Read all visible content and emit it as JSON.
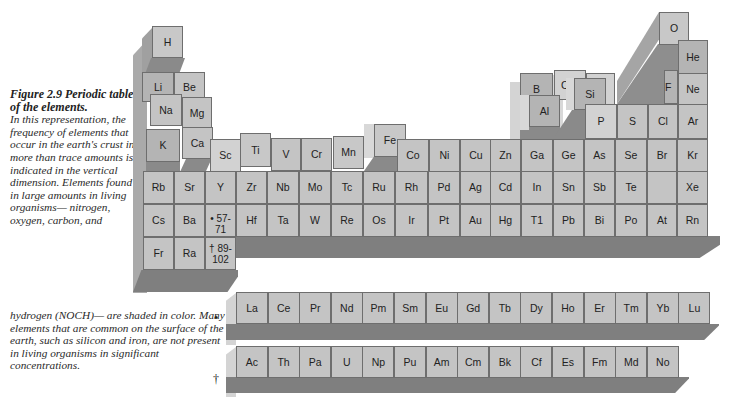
{
  "caption": {
    "title": "Figure 2.9 Periodic table of the elements.",
    "body_left": "In this representation, the frequency of elements that occur in the earth's crust in more than trace amounts is indicated in the vertical dimension. Elements found in large amounts in living organisms— nitrogen, oxygen, carbon, and",
    "body_tail": "hydrogen (NOCH)— are shaded in color. Many elements that are common on the surface of the earth, such as silicon and iron, are not present in living organisms in significant concentrations."
  },
  "main_table": {
    "raised": {
      "H": "H",
      "Li": "Li",
      "Be": "Be",
      "Na": "Na",
      "Mg": "Mg",
      "K": "K",
      "Ca": "Ca",
      "Ti": "Ti",
      "Mn": "Mn",
      "Fe": "Fe",
      "B": "B",
      "C": "C",
      "N": "N",
      "Al": "Al",
      "Si": "Si",
      "P": "P",
      "O": "O",
      "F": "F",
      "S": "S",
      "Cl": "Cl",
      "He": "He",
      "Ne": "Ne",
      "Ar": "Ar"
    },
    "row4": [
      "Sc",
      "V",
      "Cr",
      "Co",
      "Ni",
      "Cu",
      "Zn",
      "Ga",
      "Ge",
      "As",
      "Se",
      "Br",
      "Kr"
    ],
    "row5": [
      "Rb",
      "Sr",
      "Y",
      "Zr",
      "Nb",
      "Mo",
      "Tc",
      "Ru",
      "Rh",
      "Pd",
      "Ag",
      "Cd",
      "In",
      "Sn",
      "Sb",
      "Te",
      "",
      "Xe"
    ],
    "row6": [
      "Cs",
      "Ba",
      "• 57-71",
      "Hf",
      "Ta",
      "W",
      "Re",
      "Os",
      "Ir",
      "Pt",
      "Au",
      "Hg",
      "T1",
      "Pb",
      "Bi",
      "Po",
      "At",
      "Rn"
    ],
    "row7": [
      "Fr",
      "Ra",
      "† 89-102"
    ]
  },
  "lanthanides": {
    "marker": "•",
    "elements": [
      "La",
      "Ce",
      "Pr",
      "Nd",
      "Pm",
      "Sm",
      "Eu",
      "Gd",
      "Tb",
      "Dy",
      "Ho",
      "Er",
      "Tm",
      "Yb",
      "Lu"
    ]
  },
  "actinides": {
    "marker": "†",
    "elements": [
      "Ac",
      "Th",
      "Pa",
      "U",
      "Np",
      "Pu",
      "Am",
      "Cm",
      "Bk",
      "Cf",
      "Es",
      "Fm",
      "Md",
      "No"
    ]
  },
  "colors": {
    "cell": "#c4c4c4",
    "border": "#6e6e6e",
    "side": "#aaaaaa",
    "base": "#7f7f7f"
  }
}
